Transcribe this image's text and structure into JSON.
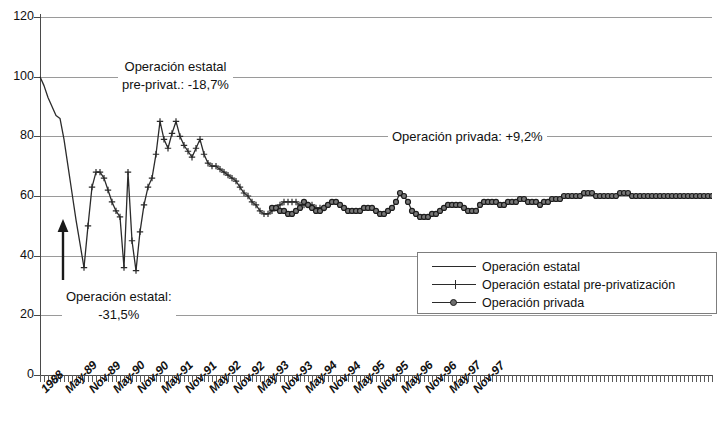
{
  "chart_data": {
    "type": "line",
    "title": "",
    "subtitle": "",
    "xlabel": "",
    "ylabel": "",
    "ylim": [
      0,
      120
    ],
    "ytick_values": [
      0,
      20,
      40,
      60,
      80,
      100,
      120
    ],
    "ytick_labels": [
      "0",
      "20",
      "40",
      "60",
      "80",
      "100",
      "120"
    ],
    "grid": true,
    "legend_position": "inside-lower-right",
    "x_axis_note": "monthly ticks from 1988 through Nov-97; labels every 6 months",
    "xtick_labels": [
      "1988",
      "May-89",
      "Nov-89",
      "May-90",
      "Nov-90",
      "May-91",
      "Nov-91",
      "May-92",
      "Nov-92",
      "May-93",
      "Nov-93",
      "May-94",
      "Nov-94",
      "May-95",
      "Nov-95",
      "May-96",
      "Nov-96",
      "May-97",
      "Nov-97"
    ],
    "x_start": "1988-12",
    "x_end": "1997-12",
    "series": [
      {
        "name": "Operación estatal",
        "marker": "none",
        "color": "#2b2b2b",
        "x_start_index": 0,
        "values": [
          100,
          97,
          93,
          90,
          87,
          86,
          79,
          70,
          61,
          52,
          44,
          36
        ]
      },
      {
        "name": "Operación estatal pre-privatización",
        "marker": "plus",
        "color": "#2b2b2b",
        "x_start_index": 11,
        "values": [
          36,
          50,
          63,
          68,
          68,
          66,
          62,
          58,
          55,
          53,
          36,
          68,
          45,
          35,
          48,
          57,
          63,
          66,
          74,
          85,
          79,
          76,
          81,
          85,
          80,
          77,
          75,
          73,
          76,
          79,
          74,
          71,
          70,
          70,
          69,
          68,
          67,
          66,
          65,
          63,
          61,
          60,
          58,
          57,
          55,
          54,
          54,
          55,
          56,
          57,
          58,
          58,
          58,
          58,
          57,
          57,
          57,
          57,
          56,
          56,
          56
        ]
      },
      {
        "name": "Operación privada",
        "marker": "circle",
        "color": "#2b2b2b",
        "x_start_index": 58,
        "values": [
          56,
          56,
          55,
          55,
          54,
          54,
          55,
          56,
          58,
          57,
          56,
          55,
          55,
          56,
          57,
          58,
          58,
          57,
          56,
          55,
          55,
          55,
          55,
          56,
          56,
          56,
          55,
          54,
          54,
          55,
          56,
          58,
          61,
          60,
          58,
          55,
          54,
          53,
          53,
          53,
          54,
          54,
          55,
          56,
          57,
          57,
          57,
          57,
          56,
          55,
          55,
          55,
          57,
          58,
          58,
          58,
          58,
          57,
          57,
          58,
          58,
          58,
          59,
          59,
          58,
          58,
          58,
          57,
          58,
          58,
          59,
          59,
          59,
          60,
          60,
          60,
          60,
          60,
          61,
          61,
          61,
          60,
          60,
          60,
          60,
          60,
          60,
          61,
          61,
          61,
          60,
          60,
          60,
          60,
          60,
          60,
          60,
          60,
          60,
          60,
          60,
          60,
          60,
          60,
          60,
          60,
          60,
          60,
          60,
          60,
          60
        ]
      }
    ],
    "annotations": [
      {
        "id": "anno-estatal-pre",
        "text_line1": "Operación estatal",
        "text_line2": "pre-privat.: -18,7%",
        "value": "-18,7%"
      },
      {
        "id": "anno-privada",
        "text": "Operación privada: +9,2%",
        "value": "+9,2%"
      },
      {
        "id": "anno-estatal",
        "text_line1": "Operación estatal:",
        "text_line2": "-31,5%",
        "value": "-31,5%"
      },
      {
        "id": "arrow-up",
        "text": "",
        "icon": "up-arrow-icon"
      }
    ]
  },
  "legend": {
    "items": [
      {
        "label": "Operación estatal",
        "marker": "line"
      },
      {
        "label": "Operación estatal pre-privatización",
        "marker": "plus"
      },
      {
        "label": "Operación privada",
        "marker": "circle"
      }
    ]
  },
  "colors": {
    "line": "#2b2b2b",
    "grid": "#9a9a9a",
    "axis": "#4a4a4a",
    "text": "#111111",
    "background": "#ffffff"
  }
}
